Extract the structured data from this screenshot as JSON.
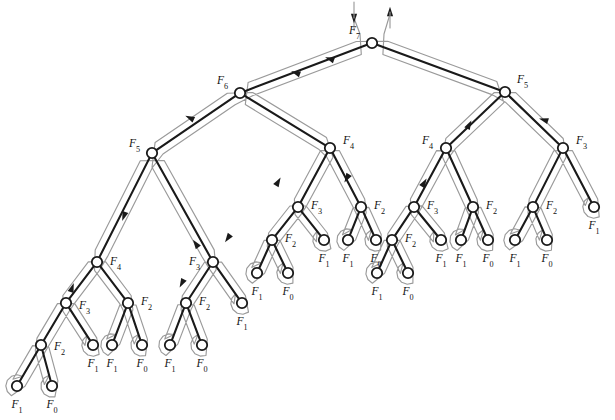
{
  "figure": {
    "name": "fibonacci-recursion-tree",
    "background_color": "#ffffff",
    "edge_color": "#1a1a1a",
    "node_fill": "#ffffff",
    "node_stroke": "#1a1a1a",
    "contour_color": "#9a9a9a",
    "arrow_color": "#1a1a1a",
    "label_color": "#111111",
    "node_radius": 5.2,
    "label_prefix": "F"
  },
  "chart_data": {
    "type": "diagram",
    "tree_root_order": 7,
    "base_cases": [
      0,
      1
    ],
    "node_count": 41,
    "nodes": [
      {
        "id": "r",
        "order": 7,
        "x": 372,
        "y": 43,
        "label": "F",
        "sub": "7",
        "label_dx": -12,
        "label_dy": -9,
        "label_anchor": "end"
      },
      {
        "id": "L",
        "order": 6,
        "x": 240,
        "y": 93,
        "label": "F",
        "sub": "6",
        "label_dx": -12,
        "label_dy": -9,
        "label_anchor": "end"
      },
      {
        "id": "R",
        "order": 5,
        "x": 505,
        "y": 92,
        "label": "F",
        "sub": "5",
        "label_dx": 12,
        "label_dy": -9,
        "label_anchor": "start"
      },
      {
        "id": "LL",
        "order": 5,
        "x": 152,
        "y": 153,
        "label": "F",
        "sub": "5",
        "label_dx": -12,
        "label_dy": -6,
        "label_anchor": "end"
      },
      {
        "id": "LR",
        "order": 4,
        "x": 330,
        "y": 148,
        "label": "F",
        "sub": "4",
        "label_dx": 13,
        "label_dy": -4,
        "label_anchor": "start"
      },
      {
        "id": "RL",
        "order": 4,
        "x": 446,
        "y": 148,
        "label": "F",
        "sub": "4",
        "label_dx": -13,
        "label_dy": -4,
        "label_anchor": "end"
      },
      {
        "id": "RR",
        "order": 3,
        "x": 563,
        "y": 148,
        "label": "F",
        "sub": "3",
        "label_dx": 13,
        "label_dy": -4,
        "label_anchor": "start"
      },
      {
        "id": "LLL",
        "order": 4,
        "x": 97,
        "y": 262,
        "label": "F",
        "sub": "4",
        "label_dx": 13,
        "label_dy": 3,
        "label_anchor": "start"
      },
      {
        "id": "LLR",
        "order": 3,
        "x": 213,
        "y": 262,
        "label": "F",
        "sub": "3",
        "label_dx": -13,
        "label_dy": 3,
        "label_anchor": "end"
      },
      {
        "id": "LRL",
        "order": 3,
        "x": 298,
        "y": 207,
        "label": "F",
        "sub": "3",
        "label_dx": 13,
        "label_dy": 2,
        "label_anchor": "start"
      },
      {
        "id": "LRR",
        "order": 2,
        "x": 361,
        "y": 207,
        "label": "F",
        "sub": "2",
        "label_dx": 13,
        "label_dy": 2,
        "label_anchor": "start"
      },
      {
        "id": "RLL",
        "order": 3,
        "x": 414,
        "y": 207,
        "label": "F",
        "sub": "3",
        "label_dx": 13,
        "label_dy": 2,
        "label_anchor": "start"
      },
      {
        "id": "RLR",
        "order": 2,
        "x": 473,
        "y": 207,
        "label": "F",
        "sub": "2",
        "label_dx": 13,
        "label_dy": 2,
        "label_anchor": "start"
      },
      {
        "id": "RRL",
        "order": 2,
        "x": 533,
        "y": 207,
        "label": "F",
        "sub": "2",
        "label_dx": 13,
        "label_dy": 2,
        "label_anchor": "start"
      },
      {
        "id": "RRR",
        "order": 1,
        "x": 594,
        "y": 207,
        "label": "F",
        "sub": "1",
        "label_dx": 0,
        "label_dy": 22,
        "label_anchor": "middle"
      },
      {
        "id": "LLLL",
        "order": 3,
        "x": 66,
        "y": 303,
        "label": "F",
        "sub": "3",
        "label_dx": 13,
        "label_dy": 6,
        "label_anchor": "start"
      },
      {
        "id": "LLLR",
        "order": 2,
        "x": 128,
        "y": 303,
        "label": "F",
        "sub": "2",
        "label_dx": 13,
        "label_dy": 2,
        "label_anchor": "start"
      },
      {
        "id": "LLRL",
        "order": 2,
        "x": 186,
        "y": 303,
        "label": "F",
        "sub": "2",
        "label_dx": 13,
        "label_dy": 2,
        "label_anchor": "start"
      },
      {
        "id": "LLRR",
        "order": 1,
        "x": 242,
        "y": 303,
        "label": "F",
        "sub": "1",
        "label_dx": 0,
        "label_dy": 22,
        "label_anchor": "middle"
      },
      {
        "id": "LRLL",
        "order": 2,
        "x": 272,
        "y": 240,
        "label": "F",
        "sub": "2",
        "label_dx": 13,
        "label_dy": 2,
        "label_anchor": "start"
      },
      {
        "id": "LRLR",
        "order": 1,
        "x": 324,
        "y": 240,
        "label": "F",
        "sub": "1",
        "label_dx": 0,
        "label_dy": 22,
        "label_anchor": "middle"
      },
      {
        "id": "LRRL",
        "order": 1,
        "x": 348,
        "y": 240,
        "label": "F",
        "sub": "1",
        "label_dx": 0,
        "label_dy": 22,
        "label_anchor": "middle"
      },
      {
        "id": "LRRR",
        "order": 0,
        "x": 376,
        "y": 240,
        "label": "F",
        "sub": "0",
        "label_dx": 0,
        "label_dy": 22,
        "label_anchor": "middle"
      },
      {
        "id": "RLLL",
        "order": 2,
        "x": 392,
        "y": 240,
        "label": "F",
        "sub": "2",
        "label_dx": 13,
        "label_dy": 2,
        "label_anchor": "start"
      },
      {
        "id": "RLLR",
        "order": 1,
        "x": 441,
        "y": 240,
        "label": "F",
        "sub": "1",
        "label_dx": 0,
        "label_dy": 22,
        "label_anchor": "middle"
      },
      {
        "id": "RLRL",
        "order": 1,
        "x": 461,
        "y": 240,
        "label": "F",
        "sub": "1",
        "label_dx": 0,
        "label_dy": 22,
        "label_anchor": "middle"
      },
      {
        "id": "RLRR",
        "order": 0,
        "x": 488,
        "y": 240,
        "label": "F",
        "sub": "0",
        "label_dx": 0,
        "label_dy": 22,
        "label_anchor": "middle"
      },
      {
        "id": "RRLL",
        "order": 1,
        "x": 515,
        "y": 240,
        "label": "F",
        "sub": "1",
        "label_dx": 0,
        "label_dy": 22,
        "label_anchor": "middle"
      },
      {
        "id": "RRLR",
        "order": 0,
        "x": 547,
        "y": 240,
        "label": "F",
        "sub": "0",
        "label_dx": 0,
        "label_dy": 22,
        "label_anchor": "middle"
      },
      {
        "id": "LLLLL",
        "order": 2,
        "x": 41,
        "y": 345,
        "label": "F",
        "sub": "2",
        "label_dx": 13,
        "label_dy": 5,
        "label_anchor": "start"
      },
      {
        "id": "LLLLR",
        "order": 1,
        "x": 93,
        "y": 345,
        "label": "F",
        "sub": "1",
        "label_dx": 0,
        "label_dy": 22,
        "label_anchor": "middle"
      },
      {
        "id": "LLLRL",
        "order": 1,
        "x": 112,
        "y": 345,
        "label": "F",
        "sub": "1",
        "label_dx": 0,
        "label_dy": 22,
        "label_anchor": "middle"
      },
      {
        "id": "LLLRR",
        "order": 0,
        "x": 142,
        "y": 345,
        "label": "F",
        "sub": "0",
        "label_dx": 0,
        "label_dy": 22,
        "label_anchor": "middle"
      },
      {
        "id": "LLRLL",
        "order": 1,
        "x": 170,
        "y": 345,
        "label": "F",
        "sub": "1",
        "label_dx": 0,
        "label_dy": 22,
        "label_anchor": "middle"
      },
      {
        "id": "LLRLR",
        "order": 0,
        "x": 202,
        "y": 345,
        "label": "F",
        "sub": "0",
        "label_dx": 0,
        "label_dy": 22,
        "label_anchor": "middle"
      },
      {
        "id": "LRLLL",
        "order": 1,
        "x": 257,
        "y": 273,
        "label": "F",
        "sub": "1",
        "label_dx": 0,
        "label_dy": 22,
        "label_anchor": "middle"
      },
      {
        "id": "LRLLR",
        "order": 0,
        "x": 288,
        "y": 273,
        "label": "F",
        "sub": "0",
        "label_dx": 0,
        "label_dy": 22,
        "label_anchor": "middle"
      },
      {
        "id": "RLLLL",
        "order": 1,
        "x": 377,
        "y": 273,
        "label": "F",
        "sub": "1",
        "label_dx": 0,
        "label_dy": 22,
        "label_anchor": "middle"
      },
      {
        "id": "RLLLR",
        "order": 0,
        "x": 408,
        "y": 273,
        "label": "F",
        "sub": "0",
        "label_dx": 0,
        "label_dy": 22,
        "label_anchor": "middle"
      },
      {
        "id": "LLLLLL",
        "order": 1,
        "x": 17,
        "y": 386,
        "label": "F",
        "sub": "1",
        "label_dx": 0,
        "label_dy": 22,
        "label_anchor": "middle"
      },
      {
        "id": "LLLLLR",
        "order": 0,
        "x": 52,
        "y": 386,
        "label": "F",
        "sub": "0",
        "label_dx": 0,
        "label_dy": 22,
        "label_anchor": "middle"
      }
    ],
    "edges": [
      [
        "r",
        "L"
      ],
      [
        "r",
        "R"
      ],
      [
        "L",
        "LL"
      ],
      [
        "L",
        "LR"
      ],
      [
        "R",
        "RL"
      ],
      [
        "R",
        "RR"
      ],
      [
        "LL",
        "LLL"
      ],
      [
        "LL",
        "LLR"
      ],
      [
        "LR",
        "LRL"
      ],
      [
        "LR",
        "LRR"
      ],
      [
        "RL",
        "RLL"
      ],
      [
        "RL",
        "RLR"
      ],
      [
        "RR",
        "RRL"
      ],
      [
        "RR",
        "RRR"
      ],
      [
        "LLL",
        "LLLL"
      ],
      [
        "LLL",
        "LLLR"
      ],
      [
        "LLR",
        "LLRL"
      ],
      [
        "LLR",
        "LLRR"
      ],
      [
        "LRL",
        "LRLL"
      ],
      [
        "LRL",
        "LRLR"
      ],
      [
        "LRR",
        "LRRL"
      ],
      [
        "LRR",
        "LRRR"
      ],
      [
        "RLL",
        "RLLL"
      ],
      [
        "RLL",
        "RLLR"
      ],
      [
        "RLR",
        "RLRL"
      ],
      [
        "RLR",
        "RLRR"
      ],
      [
        "RRL",
        "RRLL"
      ],
      [
        "RRL",
        "RRLR"
      ],
      [
        "LLLL",
        "LLLLL"
      ],
      [
        "LLLL",
        "LLLLR"
      ],
      [
        "LLLR",
        "LLLRL"
      ],
      [
        "LLLR",
        "LLLRR"
      ],
      [
        "LLRL",
        "LLRLL"
      ],
      [
        "LLRL",
        "LLRLR"
      ],
      [
        "LRLL",
        "LRLLL"
      ],
      [
        "LRLL",
        "LRLLR"
      ],
      [
        "RLLL",
        "RLLLL"
      ],
      [
        "RLLL",
        "RLLLR"
      ],
      [
        "LLLLL",
        "LLLLLL"
      ],
      [
        "LLLLL",
        "LLLLLR"
      ]
    ],
    "traversal": {
      "kind": "depth-first-contour",
      "entry_marker": "down-arrow-into-root",
      "exit_marker": "up-arrow-out-of-root",
      "direction_arrow_count": 14
    },
    "arrows": [
      {
        "id": "entry",
        "x": 354,
        "y": 18,
        "angle": 90,
        "name": "entry-arrow"
      },
      {
        "id": "exit",
        "x": 390,
        "y": 12,
        "angle": -90,
        "name": "exit-arrow"
      },
      {
        "id": "a1",
        "x": 330,
        "y": 59,
        "angle": 200,
        "name": "traversal-arrow"
      },
      {
        "id": "a2",
        "x": 296,
        "y": 73,
        "angle": 200,
        "name": "traversal-arrow"
      },
      {
        "id": "a3",
        "x": 190,
        "y": 118,
        "angle": 205,
        "name": "traversal-arrow"
      },
      {
        "id": "a4",
        "x": 124,
        "y": 216,
        "angle": 110,
        "name": "traversal-arrow"
      },
      {
        "id": "a5",
        "x": 72,
        "y": 288,
        "angle": -70,
        "name": "traversal-arrow"
      },
      {
        "id": "a6",
        "x": 196,
        "y": 244,
        "angle": -125,
        "name": "traversal-arrow"
      },
      {
        "id": "a7",
        "x": 228,
        "y": 238,
        "angle": 125,
        "name": "traversal-arrow"
      },
      {
        "id": "a8",
        "x": 182,
        "y": 283,
        "angle": 118,
        "name": "traversal-arrow"
      },
      {
        "id": "a9",
        "x": 278,
        "y": 182,
        "angle": -60,
        "name": "traversal-arrow"
      },
      {
        "id": "a10",
        "x": 347,
        "y": 178,
        "angle": 120,
        "name": "traversal-arrow"
      },
      {
        "id": "a11",
        "x": 424,
        "y": 183,
        "angle": -60,
        "name": "traversal-arrow"
      },
      {
        "id": "a12",
        "x": 469,
        "y": 125,
        "angle": -62,
        "name": "traversal-arrow"
      },
      {
        "id": "a13",
        "x": 544,
        "y": 120,
        "angle": 196,
        "name": "traversal-arrow"
      }
    ],
    "labels_legend": {
      "F7": "top-level call",
      "F6": "left child of F7",
      "F5": "right child of F7 and left child of F6",
      "F1": "base case returning 1",
      "F0": "base case returning 0"
    }
  }
}
